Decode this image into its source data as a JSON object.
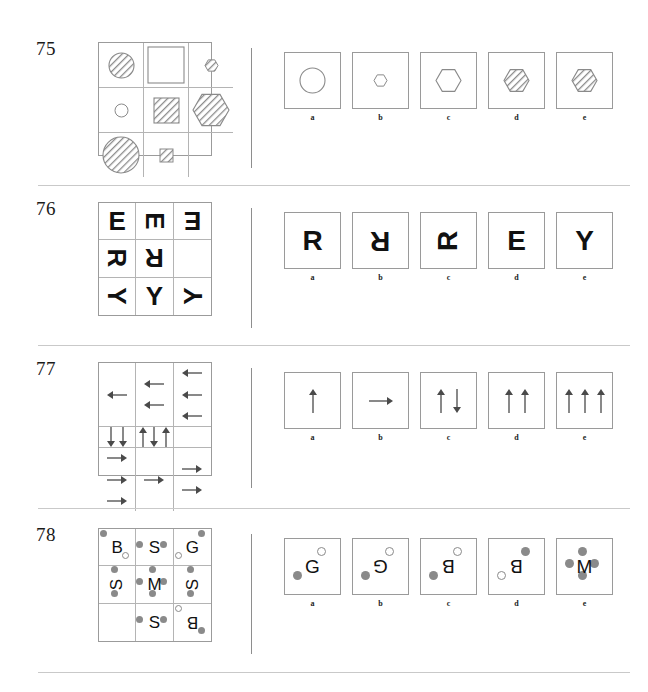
{
  "page": {
    "width": 648,
    "height": 692,
    "background": "#ffffff",
    "ink": "#111111",
    "rule_color": "#c9c9c9",
    "shape_stroke": "#8a8a8a",
    "hatch_fill": "#8e8e8e",
    "dot_fill": "#8a8a8a"
  },
  "option_labels": [
    "a",
    "b",
    "c",
    "d",
    "e"
  ],
  "problems": [
    {
      "number": "75",
      "type": "shape-matrix",
      "matrix": [
        [
          {
            "shape": "circle",
            "size": "medium",
            "fill": "hatched"
          },
          {
            "shape": "square",
            "size": "large",
            "fill": "empty"
          },
          {
            "shape": "hexagon",
            "size": "small",
            "fill": "hatched"
          }
        ],
        [
          {
            "shape": "circle",
            "size": "small",
            "fill": "empty"
          },
          {
            "shape": "square",
            "size": "medium",
            "fill": "hatched"
          },
          {
            "shape": "hexagon",
            "size": "large",
            "fill": "hatched"
          }
        ],
        [
          {
            "shape": "circle",
            "size": "large",
            "fill": "hatched"
          },
          {
            "shape": "square",
            "size": "small",
            "fill": "hatched"
          },
          {
            "shape": "blank",
            "size": "none",
            "fill": "none"
          }
        ]
      ],
      "options": [
        {
          "label": "a",
          "shape": "circle",
          "size": "medium",
          "fill": "empty"
        },
        {
          "label": "b",
          "shape": "hexagon",
          "size": "small",
          "fill": "empty"
        },
        {
          "label": "c",
          "shape": "hexagon",
          "size": "medium",
          "fill": "empty"
        },
        {
          "label": "d",
          "shape": "hexagon",
          "size": "medium",
          "fill": "hatched"
        },
        {
          "label": "e",
          "shape": "hexagon",
          "size": "medium",
          "fill": "hatched"
        }
      ]
    },
    {
      "number": "76",
      "type": "letter-rotation-matrix",
      "matrix": [
        [
          {
            "letter": "E",
            "rotation": 0
          },
          {
            "letter": "E",
            "rotation": 90
          },
          {
            "letter": "E",
            "rotation": 180
          }
        ],
        [
          {
            "letter": "R",
            "rotation": 90
          },
          {
            "letter": "R",
            "rotation": 180
          },
          {
            "letter": "",
            "rotation": 0
          }
        ],
        [
          {
            "letter": "Y",
            "rotation": 90
          },
          {
            "letter": "Y",
            "rotation": 0
          },
          {
            "letter": "Y",
            "rotation": 270
          }
        ]
      ],
      "options": [
        {
          "label": "a",
          "letter": "R",
          "rotation": 0
        },
        {
          "label": "b",
          "letter": "R",
          "rotation": 180
        },
        {
          "label": "c",
          "letter": "R",
          "rotation": 270
        },
        {
          "label": "d",
          "letter": "E",
          "rotation": 0
        },
        {
          "label": "e",
          "letter": "Y",
          "rotation": 0
        }
      ]
    },
    {
      "number": "77",
      "type": "arrow-matrix",
      "matrix": [
        [
          {
            "count": 1,
            "directions": [
              "left"
            ]
          },
          {
            "count": 2,
            "directions": [
              "left",
              "left"
            ]
          },
          {
            "count": 3,
            "directions": [
              "left",
              "left",
              "left"
            ]
          }
        ],
        [
          {
            "count": 2,
            "directions": [
              "down",
              "down"
            ]
          },
          {
            "count": 3,
            "directions": [
              "up",
              "down",
              "up"
            ]
          },
          {
            "count": 0,
            "directions": []
          }
        ],
        [
          {
            "count": 3,
            "directions": [
              "right",
              "right",
              "right"
            ]
          },
          {
            "count": 1,
            "directions": [
              "right"
            ]
          },
          {
            "count": 2,
            "directions": [
              "right",
              "right"
            ]
          }
        ]
      ],
      "options": [
        {
          "label": "a",
          "count": 1,
          "directions": [
            "up"
          ]
        },
        {
          "label": "b",
          "count": 1,
          "directions": [
            "right"
          ]
        },
        {
          "label": "c",
          "count": 2,
          "directions": [
            "up",
            "down"
          ]
        },
        {
          "label": "d",
          "count": 2,
          "directions": [
            "up",
            "up"
          ]
        },
        {
          "label": "e",
          "count": 3,
          "directions": [
            "up",
            "up",
            "up"
          ]
        }
      ]
    },
    {
      "number": "78",
      "type": "letter-dot-matrix",
      "matrix": [
        [
          {
            "letter": "B",
            "rotation": 0,
            "dots": [
              {
                "pos": "tl",
                "style": "filled"
              },
              {
                "pos": "br",
                "style": "open"
              }
            ]
          },
          {
            "letter": "S",
            "rotation": 0,
            "dots": [
              {
                "pos": "l",
                "style": "filled"
              },
              {
                "pos": "r",
                "style": "filled"
              }
            ]
          },
          {
            "letter": "G",
            "rotation": 0,
            "dots": [
              {
                "pos": "tr",
                "style": "filled"
              },
              {
                "pos": "bl",
                "style": "open"
              }
            ]
          }
        ],
        [
          {
            "letter": "S",
            "rotation": 270,
            "dots": [
              {
                "pos": "t",
                "style": "filled"
              },
              {
                "pos": "b",
                "style": "filled"
              }
            ]
          },
          {
            "letter": "M",
            "rotation": 0,
            "dots": [
              {
                "pos": "l",
                "style": "filled"
              },
              {
                "pos": "r",
                "style": "filled"
              },
              {
                "pos": "t",
                "style": "filled"
              },
              {
                "pos": "b",
                "style": "filled"
              }
            ]
          },
          {
            "letter": "S",
            "rotation": 270,
            "dots": [
              {
                "pos": "t",
                "style": "filled"
              },
              {
                "pos": "b",
                "style": "filled"
              }
            ]
          }
        ],
        [
          {
            "letter": "",
            "rotation": 0,
            "dots": []
          },
          {
            "letter": "S",
            "rotation": 0,
            "dots": [
              {
                "pos": "l",
                "style": "filled"
              },
              {
                "pos": "r",
                "style": "filled"
              }
            ]
          },
          {
            "letter": "B",
            "rotation": 180,
            "dots": [
              {
                "pos": "tl",
                "style": "open"
              },
              {
                "pos": "br",
                "style": "filled"
              }
            ]
          }
        ]
      ],
      "options": [
        {
          "label": "a",
          "letter": "G",
          "rotation": 0,
          "dots": [
            {
              "pos": "tr",
              "style": "open"
            },
            {
              "pos": "bl",
              "style": "filled"
            }
          ]
        },
        {
          "label": "b",
          "letter": "G",
          "rotation": 180,
          "dots": [
            {
              "pos": "tr",
              "style": "open"
            },
            {
              "pos": "bl",
              "style": "filled"
            }
          ]
        },
        {
          "label": "c",
          "letter": "B",
          "rotation": 180,
          "dots": [
            {
              "pos": "tr",
              "style": "open"
            },
            {
              "pos": "bl",
              "style": "filled"
            }
          ]
        },
        {
          "label": "d",
          "letter": "B",
          "rotation": 180,
          "dots": [
            {
              "pos": "tr",
              "style": "filled"
            },
            {
              "pos": "bl",
              "style": "open"
            }
          ]
        },
        {
          "label": "e",
          "letter": "M",
          "rotation": 0,
          "dots": [
            {
              "pos": "l",
              "style": "filled"
            },
            {
              "pos": "r",
              "style": "filled"
            },
            {
              "pos": "t",
              "style": "filled"
            },
            {
              "pos": "b",
              "style": "filled"
            }
          ]
        }
      ]
    }
  ],
  "layout": {
    "problem_tops": [
      38,
      198,
      358,
      524
    ],
    "matrix": {
      "left": 98,
      "width": 114,
      "height": 114
    },
    "divider": {
      "x": 251,
      "top_offset": 10,
      "height": 120
    },
    "options": {
      "left": 284,
      "box": 57,
      "gap": 11
    },
    "rules_y": [
      185,
      345,
      508,
      672
    ]
  }
}
